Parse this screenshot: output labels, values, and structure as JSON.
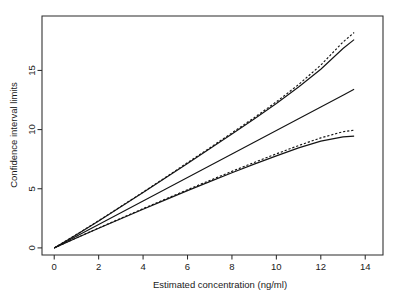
{
  "chart_data": {
    "type": "line",
    "title": "",
    "xlabel": "Estimated concentration (ng/ml)",
    "ylabel": "Confidence interval limits",
    "xlim": [
      -0.55,
      14.8
    ],
    "ylim": [
      -0.6,
      19.6
    ],
    "xticks": [
      0,
      2,
      4,
      6,
      8,
      10,
      12,
      14
    ],
    "xtick_labels": [
      "0",
      "2",
      "4",
      "6",
      "8",
      "10",
      "12",
      "14"
    ],
    "yticks": [
      0,
      5,
      10,
      15
    ],
    "ytick_labels": [
      "0",
      "5",
      "10",
      "15"
    ],
    "grid": false,
    "legend": "none",
    "x": [
      0,
      1,
      2,
      3,
      4,
      5,
      6,
      7,
      8,
      9,
      10,
      11,
      12,
      13,
      13.5
    ],
    "series": [
      {
        "name": "upper limit (dashed)",
        "style": "dashed",
        "values": [
          0,
          1.13,
          2.3,
          3.5,
          4.72,
          5.95,
          7.2,
          8.45,
          9.72,
          11.0,
          12.35,
          13.8,
          15.45,
          17.4,
          18.2
        ]
      },
      {
        "name": "upper limit (solid)",
        "style": "solid",
        "values": [
          0,
          1.12,
          2.28,
          3.47,
          4.68,
          5.9,
          7.14,
          8.38,
          9.63,
          10.9,
          12.2,
          13.6,
          15.1,
          16.85,
          17.6
        ]
      },
      {
        "name": "estimate (solid straight)",
        "style": "solid",
        "values": [
          0,
          0.99,
          1.98,
          2.98,
          3.97,
          4.96,
          5.95,
          6.95,
          7.94,
          8.93,
          9.92,
          10.92,
          11.91,
          12.9,
          13.4
        ]
      },
      {
        "name": "lower limit (dashed)",
        "style": "dashed",
        "values": [
          0,
          0.85,
          1.68,
          2.5,
          3.32,
          4.12,
          4.92,
          5.7,
          6.47,
          7.22,
          7.95,
          8.65,
          9.3,
          9.82,
          9.95
        ]
      },
      {
        "name": "lower limit (solid)",
        "style": "solid",
        "values": [
          0,
          0.84,
          1.66,
          2.47,
          3.27,
          4.06,
          4.84,
          5.6,
          6.35,
          7.08,
          7.78,
          8.45,
          9.02,
          9.38,
          9.45
        ]
      }
    ]
  }
}
